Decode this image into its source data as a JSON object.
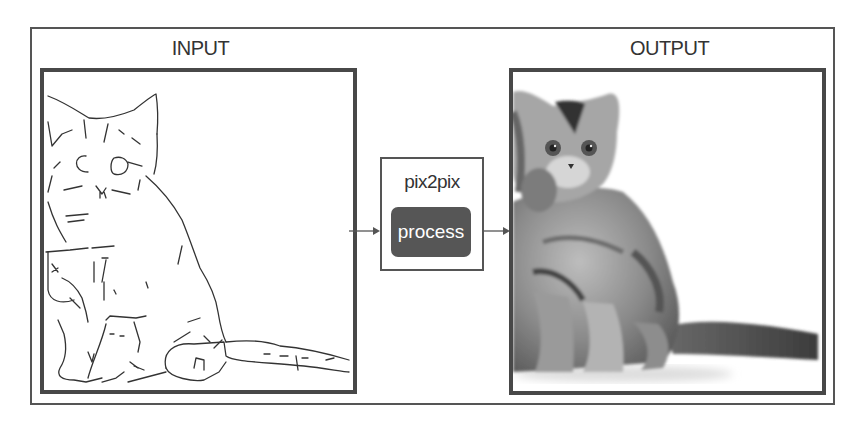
{
  "diagram": {
    "input_label": "INPUT",
    "output_label": "OUTPUT",
    "model_name": "pix2pix",
    "process_button_label": "process",
    "input_image": "cat-edge-sketch",
    "output_image": "cat-photo-generated"
  },
  "colors": {
    "border": "#555555",
    "panel_border": "#484848",
    "button_fill": "#565656",
    "button_text": "#ffffff",
    "text": "#333333"
  }
}
